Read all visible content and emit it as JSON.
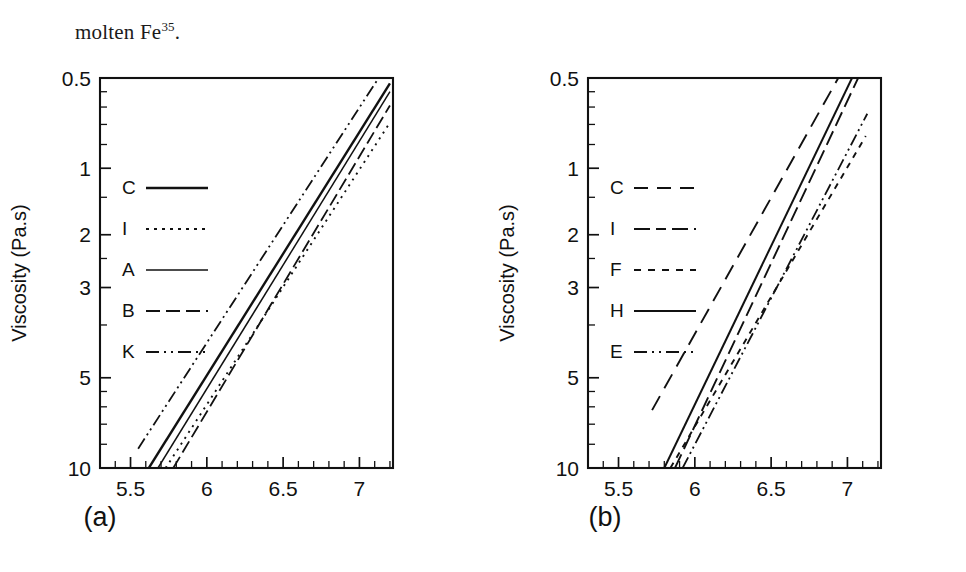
{
  "figure": {
    "caption_fragment_prefix": "molten Fe",
    "caption_fragment_sup": "35",
    "caption_fragment_suffix": ".",
    "line_color": "#111111",
    "background_color": "#ffffff"
  },
  "panels": [
    {
      "key": "a",
      "subcaption": "(a)"
    },
    {
      "key": "b",
      "subcaption": "(b)"
    }
  ],
  "axes": {
    "y_title": "Viscosity (Pa.s)",
    "x_title_mantissa": "10",
    "x_title_exp": "4",
    "x_title_mid": ".T",
    "x_title_exp2": "-1",
    "x_title_unit_open": " (K",
    "x_title_exp3": "-1",
    "x_title_unit_close": ")",
    "y_tick_labels": [
      "10",
      "5",
      "3",
      "2",
      "1",
      "0.5"
    ],
    "x_tick_labels": [
      "5.5",
      "6",
      "6.5",
      "7"
    ]
  },
  "chart_data": [
    {
      "type": "line",
      "panel": "a",
      "title": "",
      "subcaption": "(a)",
      "xlabel": "10^4.T^-1 (K^-1)",
      "ylabel": "Viscosity (Pa.s)",
      "yscale": "log",
      "xscale": "linear",
      "xlim": [
        5.3,
        7.22
      ],
      "ylim": [
        0.5,
        10
      ],
      "x_ticks": [
        5.5,
        6.0,
        6.5,
        7.0
      ],
      "x_minor_ticks_per_interval": 4,
      "y_ticks": [
        0.5,
        1,
        2,
        3,
        5,
        10
      ],
      "grid": false,
      "legend_position": "upper-left-inside",
      "series": [
        {
          "name": "C",
          "style": "solid-thick",
          "stroke_width": 2.4,
          "dash": "none",
          "points": [
            [
              5.62,
              0.5
            ],
            [
              7.2,
              9.6
            ]
          ]
        },
        {
          "name": "I",
          "style": "dotted",
          "stroke_width": 1.9,
          "dash": "2,5",
          "points": [
            [
              5.73,
              0.5
            ],
            [
              7.2,
              7.1
            ]
          ]
        },
        {
          "name": "A",
          "style": "solid-thin",
          "stroke_width": 1.5,
          "dash": "none",
          "points": [
            [
              5.68,
              0.5
            ],
            [
              7.2,
              9.0
            ]
          ]
        },
        {
          "name": "B",
          "style": "dash-dot",
          "stroke_width": 1.8,
          "dash": "13,5,13,5",
          "points": [
            [
              5.78,
              0.5
            ],
            [
              7.2,
              8.1
            ]
          ]
        },
        {
          "name": "K",
          "style": "dash-dot-dot",
          "stroke_width": 1.8,
          "dash": "12,4,2,4,2,4",
          "points": [
            [
              5.55,
              0.58
            ],
            [
              7.12,
              9.9
            ]
          ]
        }
      ]
    },
    {
      "type": "line",
      "panel": "b",
      "title": "",
      "subcaption": "(b)",
      "xlabel": "10^4.T^-1 (K^-1)",
      "ylabel": "Viscosity (Pa.s)",
      "yscale": "log",
      "xscale": "linear",
      "xlim": [
        5.3,
        7.22
      ],
      "ylim": [
        0.5,
        10
      ],
      "x_ticks": [
        5.5,
        6.0,
        6.5,
        7.0
      ],
      "x_minor_ticks_per_interval": 4,
      "y_ticks": [
        0.5,
        1,
        2,
        3,
        5,
        10
      ],
      "grid": false,
      "legend_position": "upper-left-inside",
      "series": [
        {
          "name": "C",
          "style": "long-dash",
          "stroke_width": 1.9,
          "dash": "16,9",
          "points": [
            [
              5.72,
              0.78
            ],
            [
              6.94,
              10.0
            ]
          ]
        },
        {
          "name": "I",
          "style": "medium-dash",
          "stroke_width": 1.9,
          "dash": "15,6",
          "points": [
            [
              5.87,
              0.5
            ],
            [
              7.07,
              10.0
            ]
          ]
        },
        {
          "name": "F",
          "style": "short-dash",
          "stroke_width": 1.9,
          "dash": "6,6",
          "points": [
            [
              5.84,
              0.5
            ],
            [
              7.12,
              6.4
            ]
          ]
        },
        {
          "name": "H",
          "style": "solid",
          "stroke_width": 2.0,
          "dash": "none",
          "points": [
            [
              5.8,
              0.5
            ],
            [
              7.03,
              10.0
            ]
          ]
        },
        {
          "name": "E",
          "style": "dash-dot-dot",
          "stroke_width": 1.8,
          "dash": "12,4,2,4,2,4",
          "points": [
            [
              5.92,
              0.5
            ],
            [
              7.13,
              7.6
            ]
          ]
        }
      ]
    }
  ],
  "legends": {
    "a": {
      "items": [
        {
          "label": "C",
          "dash": "none",
          "stroke_width": 2.6
        },
        {
          "label": "I",
          "dash": "3,5",
          "stroke_width": 2.2
        },
        {
          "label": "A",
          "dash": "none",
          "stroke_width": 1.6
        },
        {
          "label": "B",
          "dash": "14,6,14,6",
          "stroke_width": 2.1
        },
        {
          "label": "K",
          "dash": "13,5,2,5,2,5",
          "stroke_width": 2.1
        }
      ]
    },
    "b": {
      "items": [
        {
          "label": "C",
          "dash": "14,9",
          "stroke_width": 2.1
        },
        {
          "label": "I",
          "dash": "16,6,10,6",
          "stroke_width": 2.1
        },
        {
          "label": "F",
          "dash": "7,7",
          "stroke_width": 2.1
        },
        {
          "label": "H",
          "dash": "none",
          "stroke_width": 2.0
        },
        {
          "label": "E",
          "dash": "13,5,2,5,2,5",
          "stroke_width": 2.1
        }
      ]
    }
  }
}
